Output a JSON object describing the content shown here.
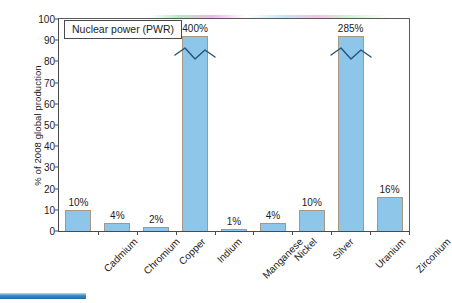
{
  "chart_data": {
    "type": "bar",
    "title": "",
    "legend_label": "Nuclear power (PWR)",
    "legend_position": "top-left-inside",
    "xlabel": "",
    "ylabel": "% of 2008 global production",
    "ylim": [
      0,
      100
    ],
    "ytick_step": 10,
    "yticks": [
      0,
      10,
      20,
      30,
      40,
      50,
      60,
      70,
      80,
      90,
      100
    ],
    "grid": false,
    "categories": [
      "Cadmium",
      "Chromium",
      "Copper",
      "Indium",
      "Manganese",
      "Nickel",
      "Silver",
      "Uranium",
      "Zirconium"
    ],
    "values": [
      10,
      4,
      2,
      400,
      1,
      4,
      10,
      285,
      16
    ],
    "value_labels": [
      "10%",
      "4%",
      "2%",
      "400%",
      "1%",
      "4%",
      "10%",
      "285%",
      "16%"
    ],
    "truncated_bars": [
      "Indium",
      "Uranium"
    ],
    "axis_break_note": "Indium and Uranium bars exceed the 100% axis and are drawn truncated with a zigzag break symbol",
    "bar_color": "#8ec6e9",
    "bar_border_color": "#a89880",
    "axis_color": "#4a4a4a"
  },
  "accent": {
    "bottom_bar_color": "#2e75b6"
  }
}
